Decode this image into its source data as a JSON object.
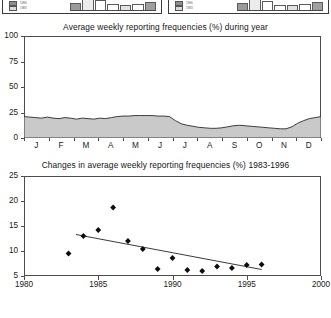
{
  "top_panels": {
    "note": "two partially cropped bar-chart panels",
    "left": {
      "legend": [
        {
          "label": "1996"
        },
        {
          "label": "1983"
        }
      ],
      "bars": [
        62,
        95,
        80,
        46,
        40,
        52,
        70
      ]
    },
    "right": {
      "legend": [
        {
          "label": "1996"
        },
        {
          "label": "1983"
        }
      ],
      "bars": [
        58,
        92,
        78,
        44,
        38,
        50,
        66
      ]
    }
  },
  "chart_data": [
    {
      "id": "seasonal",
      "type": "area",
      "title": "Average weekly reporting frequencies (%) during year",
      "xlabel": "",
      "ylabel": "",
      "ylim": [
        0,
        100
      ],
      "yticks": [
        0,
        25,
        50,
        75,
        100
      ],
      "categories": [
        "J",
        "F",
        "M",
        "A",
        "M",
        "J",
        "J",
        "A",
        "S",
        "O",
        "N",
        "D"
      ],
      "x": [
        0,
        1,
        2,
        3,
        4,
        5,
        6,
        7,
        8,
        9,
        10,
        11,
        12,
        13,
        14,
        15,
        16,
        17,
        18,
        19,
        20,
        21,
        22,
        23,
        24,
        25,
        26,
        27,
        28,
        29,
        30,
        31,
        32,
        33,
        34,
        35,
        36,
        37,
        38,
        39,
        40,
        41,
        42,
        43,
        44,
        45,
        46,
        47,
        48,
        49,
        50,
        51
      ],
      "values": [
        21,
        20.5,
        20,
        19.5,
        20.5,
        19.5,
        19,
        20,
        19.5,
        18.5,
        19.5,
        19,
        18.5,
        19.5,
        19,
        20,
        21,
        21.5,
        21.5,
        22,
        22,
        22,
        22,
        21.5,
        21.5,
        21,
        17,
        14,
        12.5,
        11.5,
        10.5,
        10,
        9.5,
        9.5,
        10,
        11,
        12,
        12.5,
        12,
        11.5,
        11,
        10.5,
        10,
        9.5,
        9,
        9,
        11,
        14.5,
        17,
        19,
        20,
        21
      ],
      "grid": false,
      "legend": "none",
      "fill_color": "#c9c9c9",
      "line_color": "#2b2b2b"
    },
    {
      "id": "trend",
      "type": "scatter",
      "title": "Changes in average weekly reporting frequencies (%) 1983-1996",
      "xlabel": "",
      "ylabel": "",
      "xlim": [
        1980,
        2000
      ],
      "ylim": [
        5,
        25
      ],
      "xticks": [
        1980,
        1985,
        1990,
        1995,
        2000
      ],
      "yticks": [
        5,
        10,
        15,
        20,
        25
      ],
      "points": [
        {
          "x": 1983,
          "y": 9.5
        },
        {
          "x": 1984,
          "y": 13.0
        },
        {
          "x": 1985,
          "y": 14.2
        },
        {
          "x": 1986,
          "y": 18.7
        },
        {
          "x": 1987,
          "y": 12.0
        },
        {
          "x": 1988,
          "y": 10.4
        },
        {
          "x": 1989,
          "y": 6.4
        },
        {
          "x": 1990,
          "y": 8.6
        },
        {
          "x": 1991,
          "y": 6.2
        },
        {
          "x": 1992,
          "y": 6.0
        },
        {
          "x": 1993,
          "y": 6.9
        },
        {
          "x": 1994,
          "y": 6.6
        },
        {
          "x": 1995,
          "y": 7.2
        },
        {
          "x": 1996,
          "y": 7.3
        }
      ],
      "trendline": {
        "x1": 1983.5,
        "y1": 13.3,
        "x2": 1996.0,
        "y2": 6.3
      },
      "grid": false,
      "legend": "none",
      "marker_color": "#0d0d0d",
      "line_color": "#3a3a3a"
    }
  ]
}
